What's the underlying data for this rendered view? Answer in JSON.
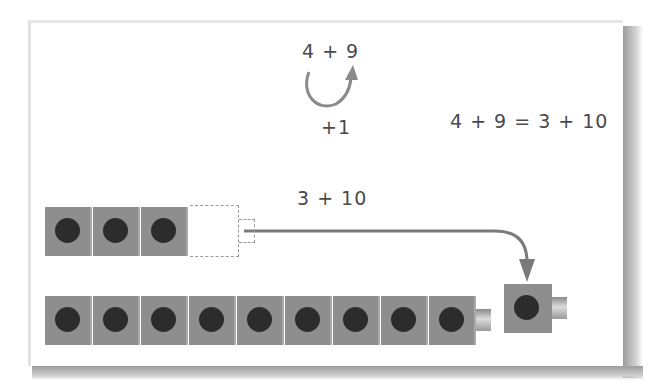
{
  "diagram": {
    "expression_top": "4 + 9",
    "move_label": "+1",
    "equation": "4 + 9 = 3 + 10",
    "regrouped_expression": "3 + 10",
    "top_row": {
      "cubes": 3,
      "ghost_cubes": 1
    },
    "bottom_row": {
      "cubes": 9
    },
    "moved_cube": {
      "cubes": 1
    },
    "colors": {
      "cube": "#8e8e8e",
      "dot": "#2c2c2c",
      "arrow": "#7a7a7a",
      "text": "#4a4a4a"
    }
  }
}
